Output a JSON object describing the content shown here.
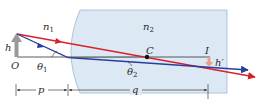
{
  "diagram": {
    "type": "refraction-at-spherical-surface",
    "labels": {
      "n1": "n",
      "n1_sub": "1",
      "n2": "n",
      "n2_sub": "2",
      "h": "h",
      "O": "O",
      "theta1": "θ",
      "theta1_sub": "1",
      "theta2": "θ",
      "theta2_sub": "2",
      "C": "C",
      "I": "I",
      "h_prime": "h′",
      "p": "p",
      "q": "q"
    },
    "colors": {
      "medium2_fill": "#dce9f5",
      "medium2_edge": "#9bb8d6",
      "red_ray": "#d9202a",
      "blue_ray": "#2a3d9a",
      "axis": "#333333",
      "object_arrow": "#9a9a9a",
      "image_arrow": "#e8a08a"
    }
  }
}
